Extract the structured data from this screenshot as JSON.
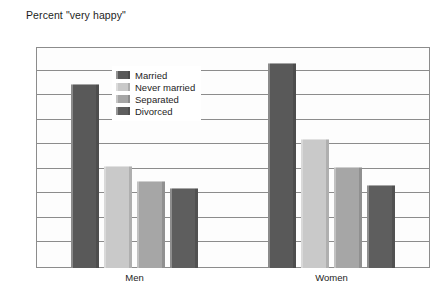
{
  "chart_data": {
    "type": "bar",
    "title": "Percent \"very happy\"",
    "xlabel": "",
    "ylabel": "",
    "categories": [
      "Men",
      "Women"
    ],
    "series": [
      {
        "name": "Married",
        "values": [
          37.5,
          41.8
        ],
        "color": "#595959"
      },
      {
        "name": "Never married",
        "values": [
          20.7,
          26.2
        ],
        "color": "#c9c9c9"
      },
      {
        "name": "Separated",
        "values": [
          17.8,
          20.6
        ],
        "color": "#a6a6a6"
      },
      {
        "name": "Divorced",
        "values": [
          16.2,
          17.0
        ],
        "color": "#5e5e5e"
      }
    ],
    "ylim": [
      0,
      45
    ],
    "ytick_step": 5,
    "yticks": [
      0,
      5,
      10,
      15,
      20,
      25,
      30,
      35,
      40,
      45
    ],
    "ytick_labels": [
      "0",
      "5",
      "10",
      "15",
      "20",
      "25",
      "30",
      "35",
      "40",
      "45"
    ],
    "grid": true,
    "grid_axis": "y",
    "legend_position": "inside-upper-left",
    "legend_entries": [
      "Married",
      "Never married",
      "Separated",
      "Divorced"
    ]
  },
  "style": {
    "plot_background": "#fdfdfd",
    "frame_color": "#8c8c8c",
    "grid_color": "#8c8c8c",
    "text_color": "#1d1d1d",
    "page_background": "#ffffff"
  }
}
